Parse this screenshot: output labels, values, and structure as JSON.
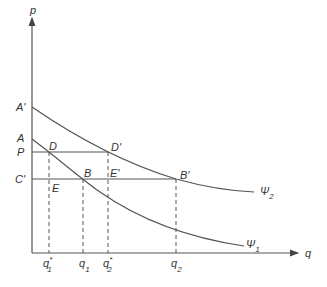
{
  "axes": {
    "y_label": "p",
    "x_label": "q"
  },
  "price_labels": {
    "a_prime": "A'",
    "a": "A",
    "p": "P",
    "c_prime": "C'"
  },
  "points": {
    "d": "D",
    "d_prime": "D'",
    "e": "E",
    "b": "B",
    "e_prime": "E'",
    "b_prime": "B'"
  },
  "curves": {
    "psi2": {
      "symbol": "Ψ",
      "sub": "2"
    },
    "psi1": {
      "symbol": "Ψ",
      "sub": "1"
    }
  },
  "quantity_labels": {
    "q1_star": {
      "base": "q",
      "sup": "*",
      "sub": "1"
    },
    "q1": {
      "base": "q",
      "sub": "1"
    },
    "q2_star": {
      "base": "q",
      "sup": "*",
      "sub": "2"
    },
    "q2": {
      "base": "q",
      "sub": "2"
    }
  },
  "colors": {
    "line": "#555555",
    "text": "#333333"
  }
}
